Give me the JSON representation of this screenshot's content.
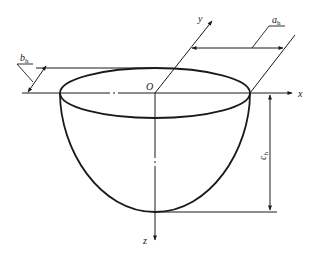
{
  "diagram": {
    "type": "hemi-ellipsoid head geometry",
    "origin_label": "O",
    "axes": {
      "x": "x",
      "y": "y",
      "z": "z"
    },
    "dimensions": {
      "a": {
        "base": "a",
        "sub": "h"
      },
      "b": {
        "base": "b",
        "sub": "h"
      },
      "c": {
        "base": "c",
        "sub": "h"
      }
    },
    "colors": {
      "line": "#1a1a1a",
      "background": "#ffffff"
    }
  }
}
